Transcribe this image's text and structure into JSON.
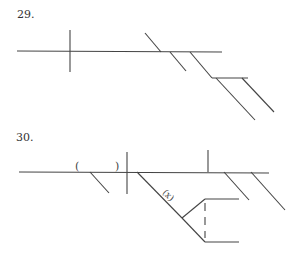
{
  "diagrams": [
    {
      "number": "29.",
      "description": "Sentence diagram skeleton with baseline, subject/verb divider, modifier slants and a compound prepositional branch"
    },
    {
      "number": "30.",
      "description": "Sentence diagram skeleton with parenthetical blank, verb divider, diagonal labeled (x) splitting into two branches, and modifier slants",
      "parens": [
        "(",
        ")"
      ],
      "branch_label": "(x)"
    }
  ],
  "colors": {
    "line": "#444444",
    "text": "#333333",
    "background": "#ffffff"
  }
}
